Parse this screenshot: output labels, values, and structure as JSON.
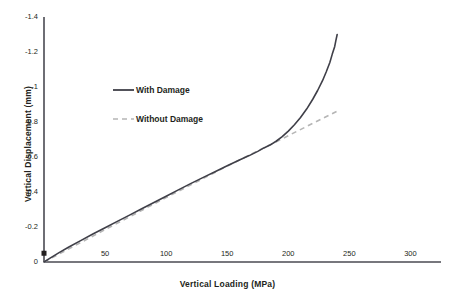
{
  "chart_data": {
    "type": "line",
    "title": "",
    "xlabel": "Vertical Loading (MPa)",
    "ylabel": "Vertical Displacement (mm)",
    "xlim": [
      0,
      325
    ],
    "ylim": [
      0,
      -1.4
    ],
    "y_axis_inverted": true,
    "grid": false,
    "legend_position": "upper-left-inside",
    "xticks": [
      {
        "value": 50,
        "label": "50"
      },
      {
        "value": 100,
        "label": "100"
      },
      {
        "value": 150,
        "label": "150"
      },
      {
        "value": 200,
        "label": "200"
      },
      {
        "value": 250,
        "label": "250"
      },
      {
        "value": 300,
        "label": "300"
      }
    ],
    "yticks": [
      {
        "value": -1.4,
        "label": "-1.4"
      },
      {
        "value": -1.2,
        "label": "-1.2"
      },
      {
        "value": -1.0,
        "label": "-1"
      },
      {
        "value": -0.8,
        "label": "-0.8"
      },
      {
        "value": -0.6,
        "label": "-0.6"
      },
      {
        "value": -0.4,
        "label": "-0.4"
      },
      {
        "value": -0.2,
        "label": "-0.2"
      },
      {
        "value": 0,
        "label": "0"
      }
    ],
    "origin_marker": {
      "x": 0,
      "y": -0.05,
      "shape": "square",
      "color": "#231f20"
    },
    "series": [
      {
        "name": "With Damage",
        "style": "solid",
        "color": "#3f3f48",
        "width": 1.6,
        "points": [
          [
            0,
            0.0
          ],
          [
            5,
            -0.022
          ],
          [
            12,
            -0.052
          ],
          [
            20,
            -0.084
          ],
          [
            30,
            -0.122
          ],
          [
            40,
            -0.16
          ],
          [
            50,
            -0.196
          ],
          [
            60,
            -0.232
          ],
          [
            70,
            -0.268
          ],
          [
            80,
            -0.304
          ],
          [
            90,
            -0.34
          ],
          [
            100,
            -0.376
          ],
          [
            110,
            -0.412
          ],
          [
            120,
            -0.448
          ],
          [
            130,
            -0.482
          ],
          [
            140,
            -0.516
          ],
          [
            150,
            -0.55
          ],
          [
            160,
            -0.583
          ],
          [
            168,
            -0.608
          ],
          [
            175,
            -0.632
          ],
          [
            180,
            -0.652
          ],
          [
            185,
            -0.668
          ],
          [
            190,
            -0.69
          ],
          [
            195,
            -0.716
          ],
          [
            200,
            -0.748
          ],
          [
            205,
            -0.784
          ],
          [
            210,
            -0.826
          ],
          [
            215,
            -0.874
          ],
          [
            220,
            -0.93
          ],
          [
            224,
            -0.98
          ],
          [
            228,
            -1.036
          ],
          [
            231,
            -1.086
          ],
          [
            234,
            -1.14
          ],
          [
            236,
            -1.188
          ],
          [
            238,
            -1.232
          ],
          [
            239,
            -1.268
          ],
          [
            240,
            -1.3
          ]
        ]
      },
      {
        "name": "Without Damage",
        "style": "dashed",
        "color": "#b5b5b5",
        "width": 1.6,
        "points": [
          [
            0,
            0.0
          ],
          [
            50,
            -0.185
          ],
          [
            100,
            -0.368
          ],
          [
            150,
            -0.548
          ],
          [
            180,
            -0.652
          ],
          [
            200,
            -0.722
          ],
          [
            220,
            -0.792
          ],
          [
            240,
            -0.862
          ]
        ]
      }
    ],
    "annotations": {
      "divergence_load": 180,
      "divergence_note": "Curves coincide below ~180 MPa, then the damaged response softens."
    }
  },
  "legend": {
    "items": [
      {
        "label": "With Damage",
        "style": "solid",
        "color": "#3f3f48"
      },
      {
        "label": "Without Damage",
        "style": "dashed",
        "color": "#b5b5b5"
      }
    ]
  },
  "colors": {
    "with_damage": "#3f3f48",
    "without_damage": "#b5b5b5",
    "axis": "#4a4a52",
    "text": "#231f20",
    "background": "#ffffff"
  }
}
